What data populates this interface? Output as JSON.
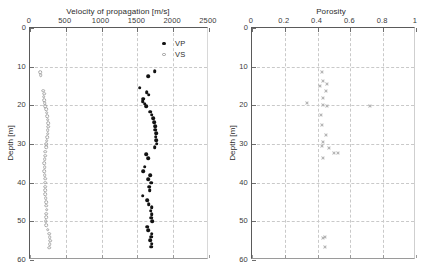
{
  "figure": {
    "background": "#ffffff",
    "caption_fragment": ""
  },
  "legend": {
    "position": "top-right-inside-left-panel",
    "entries": [
      {
        "label": "VP",
        "marker": "filled-circle",
        "color": "#121212"
      },
      {
        "label": "VS",
        "marker": "open-circle",
        "color": "#9a9a9a"
      }
    ]
  },
  "chart_data": [
    {
      "id": "velocity-panel",
      "type": "scatter",
      "title": "Velocity of propagation [m/s]",
      "xlabel": "Velocity of propagation [m/s]",
      "ylabel": "Depth [m]",
      "xlim": [
        0,
        2500
      ],
      "ylim": [
        60,
        0
      ],
      "y_inverted": true,
      "x_ticks": [
        0,
        500,
        1000,
        1500,
        2000,
        2500
      ],
      "x_tick_labels": [
        "0",
        "500",
        "1000",
        "1500",
        "2000",
        "2500"
      ],
      "y_ticks": [
        0,
        10,
        20,
        30,
        40,
        50,
        60
      ],
      "y_tick_labels": [
        "0",
        "10",
        "20",
        "30",
        "40",
        "50",
        "60"
      ],
      "grid": true,
      "x_axis_position": "top",
      "legend_position": "upper right",
      "series": [
        {
          "name": "VP",
          "marker": "filled-circle",
          "color": "#121212",
          "points": [
            [
              1740,
              11.2
            ],
            [
              1655,
              12.5
            ],
            [
              1530,
              15.4
            ],
            [
              1630,
              16.6
            ],
            [
              1660,
              17.3
            ],
            [
              1585,
              18.3
            ],
            [
              1575,
              19.0
            ],
            [
              1600,
              19.6
            ],
            [
              1620,
              20.3
            ],
            [
              1675,
              21.6
            ],
            [
              1700,
              22.4
            ],
            [
              1720,
              23.4
            ],
            [
              1735,
              24.4
            ],
            [
              1745,
              25.4
            ],
            [
              1750,
              26.3
            ],
            [
              1760,
              27.2
            ],
            [
              1755,
              28.1
            ],
            [
              1765,
              29.0
            ],
            [
              1770,
              29.9
            ],
            [
              1740,
              30.8
            ],
            [
              1620,
              32.6
            ],
            [
              1650,
              33.6
            ],
            [
              1600,
              35.9
            ],
            [
              1585,
              37.0
            ],
            [
              1680,
              38.1
            ],
            [
              1650,
              39.1
            ],
            [
              1690,
              40.0
            ],
            [
              1665,
              41.0
            ],
            [
              1670,
              42.0
            ],
            [
              1575,
              43.4
            ],
            [
              1640,
              44.6
            ],
            [
              1660,
              45.6
            ],
            [
              1700,
              46.4
            ],
            [
              1685,
              47.3
            ],
            [
              1700,
              48.2
            ],
            [
              1690,
              49.1
            ],
            [
              1710,
              50.0
            ],
            [
              1640,
              51.4
            ],
            [
              1655,
              52.3
            ],
            [
              1700,
              53.2
            ],
            [
              1690,
              54.0
            ],
            [
              1680,
              54.9
            ],
            [
              1700,
              55.8
            ],
            [
              1690,
              56.6
            ]
          ]
        },
        {
          "name": "VS",
          "marker": "open-circle",
          "color": "#a9a9a9",
          "points": [
            [
              140,
              11.5
            ],
            [
              150,
              12.2
            ],
            [
              185,
              16.2
            ],
            [
              195,
              17.0
            ],
            [
              190,
              17.8
            ],
            [
              200,
              18.6
            ],
            [
              205,
              19.4
            ],
            [
              210,
              20.2
            ],
            [
              225,
              21.0
            ],
            [
              235,
              21.9
            ],
            [
              240,
              22.8
            ],
            [
              250,
              23.7
            ],
            [
              255,
              24.6
            ],
            [
              255,
              25.5
            ],
            [
              250,
              26.4
            ],
            [
              245,
              27.3
            ],
            [
              240,
              28.2
            ],
            [
              235,
              29.1
            ],
            [
              230,
              30.0
            ],
            [
              225,
              30.9
            ],
            [
              215,
              32.0
            ],
            [
              210,
              33.0
            ],
            [
              205,
              34.0
            ],
            [
              200,
              35.0
            ],
            [
              205,
              36.0
            ],
            [
              200,
              37.0
            ],
            [
              205,
              38.0
            ],
            [
              210,
              39.0
            ],
            [
              215,
              40.0
            ],
            [
              215,
              41.0
            ],
            [
              210,
              42.0
            ],
            [
              215,
              43.0
            ],
            [
              220,
              44.0
            ],
            [
              230,
              45.0
            ],
            [
              225,
              46.0
            ],
            [
              235,
              47.0
            ],
            [
              230,
              48.0
            ],
            [
              225,
              49.0
            ],
            [
              220,
              50.0
            ],
            [
              225,
              51.0
            ],
            [
              245,
              52.2
            ],
            [
              265,
              53.2
            ],
            [
              275,
              54.1
            ],
            [
              280,
              55.0
            ],
            [
              275,
              55.9
            ],
            [
              270,
              56.8
            ]
          ]
        }
      ]
    },
    {
      "id": "porosity-panel",
      "type": "scatter",
      "title": "Porosity",
      "xlabel": "Porosity",
      "ylabel": "Depth [m]",
      "xlim": [
        0,
        1
      ],
      "ylim": [
        60,
        0
      ],
      "y_inverted": true,
      "x_ticks": [
        0,
        0.2,
        0.4,
        0.6,
        0.8,
        1
      ],
      "x_tick_labels": [
        "0",
        "0.2",
        "0.4",
        "0.6",
        "0.8",
        "1"
      ],
      "y_ticks": [
        0,
        10,
        20,
        30,
        40,
        50,
        60
      ],
      "y_tick_labels": [
        "0",
        "10",
        "20",
        "30",
        "40",
        "50",
        "60"
      ],
      "grid": true,
      "x_axis_position": "top",
      "series": [
        {
          "name": "Porosity",
          "marker": "x",
          "color": "#b0b0b0",
          "points": [
            [
              0.425,
              11.4
            ],
            [
              0.43,
              13.6
            ],
            [
              0.455,
              14.6
            ],
            [
              0.415,
              14.9
            ],
            [
              0.45,
              16.2
            ],
            [
              0.435,
              18.0
            ],
            [
              0.335,
              19.4
            ],
            [
              0.43,
              20.0
            ],
            [
              0.455,
              20.1
            ],
            [
              0.72,
              20.2
            ],
            [
              0.42,
              22.6
            ],
            [
              0.425,
              25.0
            ],
            [
              0.45,
              27.6
            ],
            [
              0.43,
              29.6
            ],
            [
              0.425,
              30.4
            ],
            [
              0.47,
              31.1
            ],
            [
              0.5,
              32.3
            ],
            [
              0.525,
              32.4
            ],
            [
              0.435,
              33.6
            ],
            [
              0.43,
              54.3
            ],
            [
              0.445,
              54.0
            ],
            [
              0.445,
              56.6
            ]
          ]
        }
      ]
    }
  ]
}
